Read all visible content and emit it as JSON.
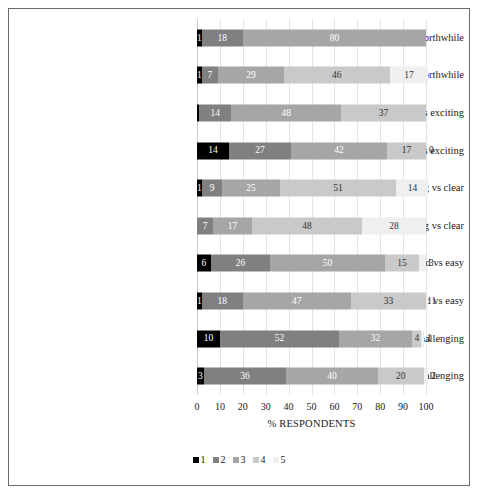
{
  "chart_data": {
    "type": "bar",
    "subtype": "stacked-horizontal-100",
    "title": "",
    "xlabel": "% RESPONDENTS",
    "ylabel": "",
    "xlim": [
      0,
      100
    ],
    "grid": true,
    "legend_position": "bottom-center",
    "xticks": [
      "0",
      "10",
      "20",
      "30",
      "40",
      "50",
      "60",
      "70",
      "80",
      "90",
      "100"
    ],
    "categories": [
      "In-lab - useless vs. worthwhile",
      "Online - useless vs. worthwhile",
      "In-lab - boring vs exciting",
      "Online - boring vs exciting",
      "In-lab - confusing vs clear",
      "Online - confusing vs clear",
      "In-lab - hard vs easy",
      "Online - hard vs easy",
      "In-lab - challenging vs unchallenging",
      "Online - challenging vs unchallenging"
    ],
    "series": [
      {
        "name": "1",
        "color": "#000000",
        "values": [
          1,
          1,
          1,
          14,
          1,
          0,
          6,
          1,
          10,
          3
        ]
      },
      {
        "name": "2",
        "color": "#808080",
        "values": [
          18,
          7,
          14,
          27,
          9,
          7,
          26,
          18,
          52,
          36
        ]
      },
      {
        "name": "3",
        "color": "#a6a6a6",
        "values": [
          80,
          29,
          48,
          42,
          25,
          17,
          50,
          47,
          32,
          40
        ]
      },
      {
        "name": "4",
        "color": "#c9c9c9",
        "values": [
          0,
          46,
          37,
          17,
          51,
          48,
          15,
          33,
          4,
          20
        ]
      },
      {
        "name": "5",
        "color": "#efefef",
        "values": [
          0,
          17,
          0,
          0,
          14,
          28,
          3,
          1,
          1,
          2
        ]
      }
    ],
    "bar_labels": [
      [
        {
          "v": "1",
          "show": true,
          "out": false
        },
        {
          "v": "18",
          "show": true,
          "out": false
        },
        {
          "v": "80",
          "show": true,
          "out": false
        },
        {
          "v": "",
          "show": false,
          "out": false
        },
        {
          "v": "",
          "show": false,
          "out": false
        }
      ],
      [
        {
          "v": "1",
          "show": true,
          "out": false
        },
        {
          "v": "7",
          "show": true,
          "out": false
        },
        {
          "v": "29",
          "show": true,
          "out": false
        },
        {
          "v": "46",
          "show": true,
          "out": false
        },
        {
          "v": "17",
          "show": true,
          "out": false
        }
      ],
      [
        {
          "v": "",
          "show": false,
          "out": false
        },
        {
          "v": "14",
          "show": true,
          "out": false
        },
        {
          "v": "48",
          "show": true,
          "out": false
        },
        {
          "v": "37",
          "show": true,
          "out": false
        },
        {
          "v": "",
          "show": false,
          "out": false
        }
      ],
      [
        {
          "v": "14",
          "show": true,
          "out": false
        },
        {
          "v": "27",
          "show": true,
          "out": false
        },
        {
          "v": "42",
          "show": true,
          "out": false
        },
        {
          "v": "17",
          "show": true,
          "out": false
        },
        {
          "v": "0",
          "show": true,
          "out": true
        }
      ],
      [
        {
          "v": "1",
          "show": true,
          "out": false
        },
        {
          "v": "9",
          "show": true,
          "out": false
        },
        {
          "v": "25",
          "show": true,
          "out": false
        },
        {
          "v": "51",
          "show": true,
          "out": false
        },
        {
          "v": "14",
          "show": true,
          "out": false
        }
      ],
      [
        {
          "v": "",
          "show": false,
          "out": false
        },
        {
          "v": "7",
          "show": true,
          "out": false
        },
        {
          "v": "17",
          "show": true,
          "out": false
        },
        {
          "v": "48",
          "show": true,
          "out": false
        },
        {
          "v": "28",
          "show": true,
          "out": false
        }
      ],
      [
        {
          "v": "6",
          "show": true,
          "out": false
        },
        {
          "v": "26",
          "show": true,
          "out": false
        },
        {
          "v": "50",
          "show": true,
          "out": false
        },
        {
          "v": "15",
          "show": true,
          "out": false
        },
        {
          "v": "3",
          "show": true,
          "out": true
        }
      ],
      [
        {
          "v": "1",
          "show": true,
          "out": false
        },
        {
          "v": "18",
          "show": true,
          "out": false
        },
        {
          "v": "47",
          "show": true,
          "out": false
        },
        {
          "v": "33",
          "show": true,
          "out": false
        },
        {
          "v": "1",
          "show": true,
          "out": true
        }
      ],
      [
        {
          "v": "10",
          "show": true,
          "out": false
        },
        {
          "v": "52",
          "show": true,
          "out": false
        },
        {
          "v": "32",
          "show": true,
          "out": false
        },
        {
          "v": "4",
          "show": true,
          "out": false
        },
        {
          "v": "1",
          "show": true,
          "out": true
        }
      ],
      [
        {
          "v": "3",
          "show": true,
          "out": false
        },
        {
          "v": "36",
          "show": true,
          "out": false
        },
        {
          "v": "40",
          "show": true,
          "out": false
        },
        {
          "v": "20",
          "show": true,
          "out": false
        },
        {
          "v": "2",
          "show": true,
          "out": true
        }
      ]
    ],
    "legend_entries": [
      {
        "label": "1",
        "color": "#000000"
      },
      {
        "label": "2",
        "color": "#808080"
      },
      {
        "label": "3",
        "color": "#a6a6a6"
      },
      {
        "label": "4",
        "color": "#c9c9c9"
      },
      {
        "label": "5",
        "color": "#efefef"
      }
    ]
  }
}
